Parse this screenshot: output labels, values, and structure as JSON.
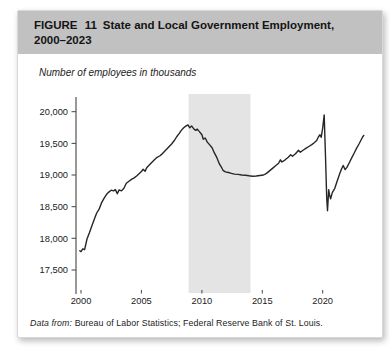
{
  "figure": {
    "figure_label": "FIGURE 11",
    "title_line1": "State and Local Government Employment,",
    "title_line2": "2000–2023",
    "units_note": "Number of employees in thousands",
    "source_prefix": "Data from:",
    "source_body": "Bureau of Labor Statistics; Federal Reserve Bank of St. Louis."
  },
  "colors": {
    "header_band": "#c1c1c1",
    "recession_band": "#e4e4e4",
    "line": "#262626",
    "axis": "#444444",
    "tick_text": "#1a1a1a"
  },
  "chart_data": {
    "type": "line",
    "title": "State and Local Government Employment, 2000–2023",
    "ylabel": "Number of employees in thousands",
    "xlabel": "",
    "xlim": [
      1999.6,
      2024.0
    ],
    "ylim": [
      17300,
      20250
    ],
    "yticks": [
      20000,
      19500,
      19000,
      18500,
      18000,
      17500
    ],
    "xticks": [
      2000,
      2005,
      2010,
      2015,
      2020
    ],
    "grid": false,
    "legend_position": "none",
    "shaded_region": {
      "x_from": 2008.9,
      "x_to": 2014.02
    },
    "series": [
      {
        "name": "State and local government employment (thousands)",
        "points": [
          [
            1999.9,
            17805
          ],
          [
            2000.0,
            17790
          ],
          [
            2000.15,
            17835
          ],
          [
            2000.3,
            17820
          ],
          [
            2000.5,
            17990
          ],
          [
            2000.7,
            18090
          ],
          [
            2000.9,
            18200
          ],
          [
            2001.1,
            18300
          ],
          [
            2001.3,
            18400
          ],
          [
            2001.5,
            18460
          ],
          [
            2001.7,
            18560
          ],
          [
            2001.9,
            18630
          ],
          [
            2002.1,
            18690
          ],
          [
            2002.3,
            18730
          ],
          [
            2002.5,
            18760
          ],
          [
            2002.7,
            18750
          ],
          [
            2002.85,
            18770
          ],
          [
            2003.0,
            18705
          ],
          [
            2003.15,
            18765
          ],
          [
            2003.35,
            18750
          ],
          [
            2003.55,
            18790
          ],
          [
            2003.75,
            18870
          ],
          [
            2004.0,
            18905
          ],
          [
            2004.2,
            18935
          ],
          [
            2004.4,
            18955
          ],
          [
            2004.6,
            18985
          ],
          [
            2004.8,
            19020
          ],
          [
            2005.0,
            19055
          ],
          [
            2005.15,
            19090
          ],
          [
            2005.3,
            19060
          ],
          [
            2005.45,
            19120
          ],
          [
            2005.65,
            19160
          ],
          [
            2005.85,
            19200
          ],
          [
            2006.1,
            19245
          ],
          [
            2006.3,
            19280
          ],
          [
            2006.5,
            19300
          ],
          [
            2006.7,
            19330
          ],
          [
            2006.9,
            19370
          ],
          [
            2007.1,
            19410
          ],
          [
            2007.3,
            19450
          ],
          [
            2007.5,
            19490
          ],
          [
            2007.7,
            19540
          ],
          [
            2007.9,
            19600
          ],
          [
            2008.1,
            19650
          ],
          [
            2008.3,
            19705
          ],
          [
            2008.5,
            19745
          ],
          [
            2008.7,
            19775
          ],
          [
            2008.85,
            19790
          ],
          [
            2009.0,
            19745
          ],
          [
            2009.15,
            19775
          ],
          [
            2009.35,
            19725
          ],
          [
            2009.5,
            19705
          ],
          [
            2009.62,
            19725
          ],
          [
            2009.8,
            19685
          ],
          [
            2010.0,
            19635
          ],
          [
            2010.12,
            19565
          ],
          [
            2010.28,
            19585
          ],
          [
            2010.45,
            19520
          ],
          [
            2010.65,
            19475
          ],
          [
            2010.85,
            19430
          ],
          [
            2011.05,
            19345
          ],
          [
            2011.25,
            19270
          ],
          [
            2011.45,
            19175
          ],
          [
            2011.6,
            19130
          ],
          [
            2011.75,
            19075
          ],
          [
            2011.95,
            19050
          ],
          [
            2012.2,
            19040
          ],
          [
            2012.45,
            19025
          ],
          [
            2012.7,
            19015
          ],
          [
            2013.0,
            19010
          ],
          [
            2013.3,
            19000
          ],
          [
            2013.6,
            18995
          ],
          [
            2013.9,
            18988
          ],
          [
            2014.2,
            18982
          ],
          [
            2014.5,
            18985
          ],
          [
            2014.8,
            18992
          ],
          [
            2015.1,
            19000
          ],
          [
            2015.35,
            19025
          ],
          [
            2015.6,
            19065
          ],
          [
            2015.85,
            19105
          ],
          [
            2016.1,
            19145
          ],
          [
            2016.35,
            19185
          ],
          [
            2016.5,
            19240
          ],
          [
            2016.62,
            19205
          ],
          [
            2016.9,
            19240
          ],
          [
            2017.15,
            19280
          ],
          [
            2017.35,
            19320
          ],
          [
            2017.5,
            19295
          ],
          [
            2017.75,
            19335
          ],
          [
            2018.0,
            19390
          ],
          [
            2018.15,
            19360
          ],
          [
            2018.4,
            19395
          ],
          [
            2018.6,
            19420
          ],
          [
            2018.85,
            19450
          ],
          [
            2019.1,
            19480
          ],
          [
            2019.3,
            19510
          ],
          [
            2019.5,
            19545
          ],
          [
            2019.65,
            19605
          ],
          [
            2019.78,
            19635
          ],
          [
            2019.88,
            19595
          ],
          [
            2020.0,
            19745
          ],
          [
            2020.12,
            19950
          ],
          [
            2020.22,
            19350
          ],
          [
            2020.33,
            18640
          ],
          [
            2020.4,
            18435
          ],
          [
            2020.5,
            18770
          ],
          [
            2020.57,
            18680
          ],
          [
            2020.65,
            18625
          ],
          [
            2020.8,
            18725
          ],
          [
            2021.0,
            18790
          ],
          [
            2021.2,
            18905
          ],
          [
            2021.4,
            19015
          ],
          [
            2021.55,
            19090
          ],
          [
            2021.7,
            19150
          ],
          [
            2021.85,
            19085
          ],
          [
            2022.0,
            19120
          ],
          [
            2022.2,
            19195
          ],
          [
            2022.4,
            19270
          ],
          [
            2022.6,
            19345
          ],
          [
            2022.8,
            19420
          ],
          [
            2023.0,
            19490
          ],
          [
            2023.15,
            19545
          ],
          [
            2023.3,
            19600
          ],
          [
            2023.4,
            19625
          ]
        ]
      }
    ]
  }
}
